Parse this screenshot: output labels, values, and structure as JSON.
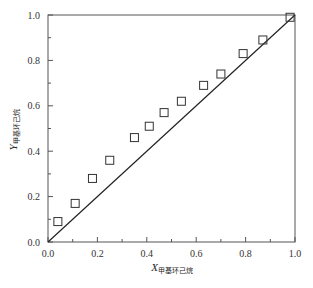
{
  "chart_data": {
    "type": "scatter",
    "title": "",
    "xlabel": "X甲基环己烷",
    "ylabel": "Y甲基环己烷",
    "xlabel_main": "X",
    "xlabel_sub": "甲基环己烷",
    "ylabel_main": "Y",
    "ylabel_sub": "甲基环己烷",
    "xlim": [
      0.0,
      1.0
    ],
    "ylim": [
      0.0,
      1.0
    ],
    "xticks": [
      "0.0",
      "0.2",
      "0.4",
      "0.6",
      "0.8",
      "1.0"
    ],
    "yticks": [
      "0.0",
      "0.2",
      "0.4",
      "0.6",
      "0.8",
      "1.0"
    ],
    "grid": false,
    "legend": null,
    "series": [
      {
        "name": "experimental",
        "marker": "open-square",
        "x": [
          0.04,
          0.11,
          0.18,
          0.25,
          0.35,
          0.41,
          0.47,
          0.54,
          0.63,
          0.7,
          0.79,
          0.87,
          0.98
        ],
        "y": [
          0.09,
          0.17,
          0.28,
          0.36,
          0.46,
          0.51,
          0.57,
          0.62,
          0.69,
          0.74,
          0.83,
          0.89,
          0.99
        ]
      },
      {
        "name": "diagonal y=x",
        "type": "line",
        "x": [
          0.0,
          1.0
        ],
        "y": [
          0.0,
          1.0
        ]
      }
    ]
  },
  "colors": {
    "axis": "#555555",
    "marker": "#333333",
    "line": "#222222"
  }
}
